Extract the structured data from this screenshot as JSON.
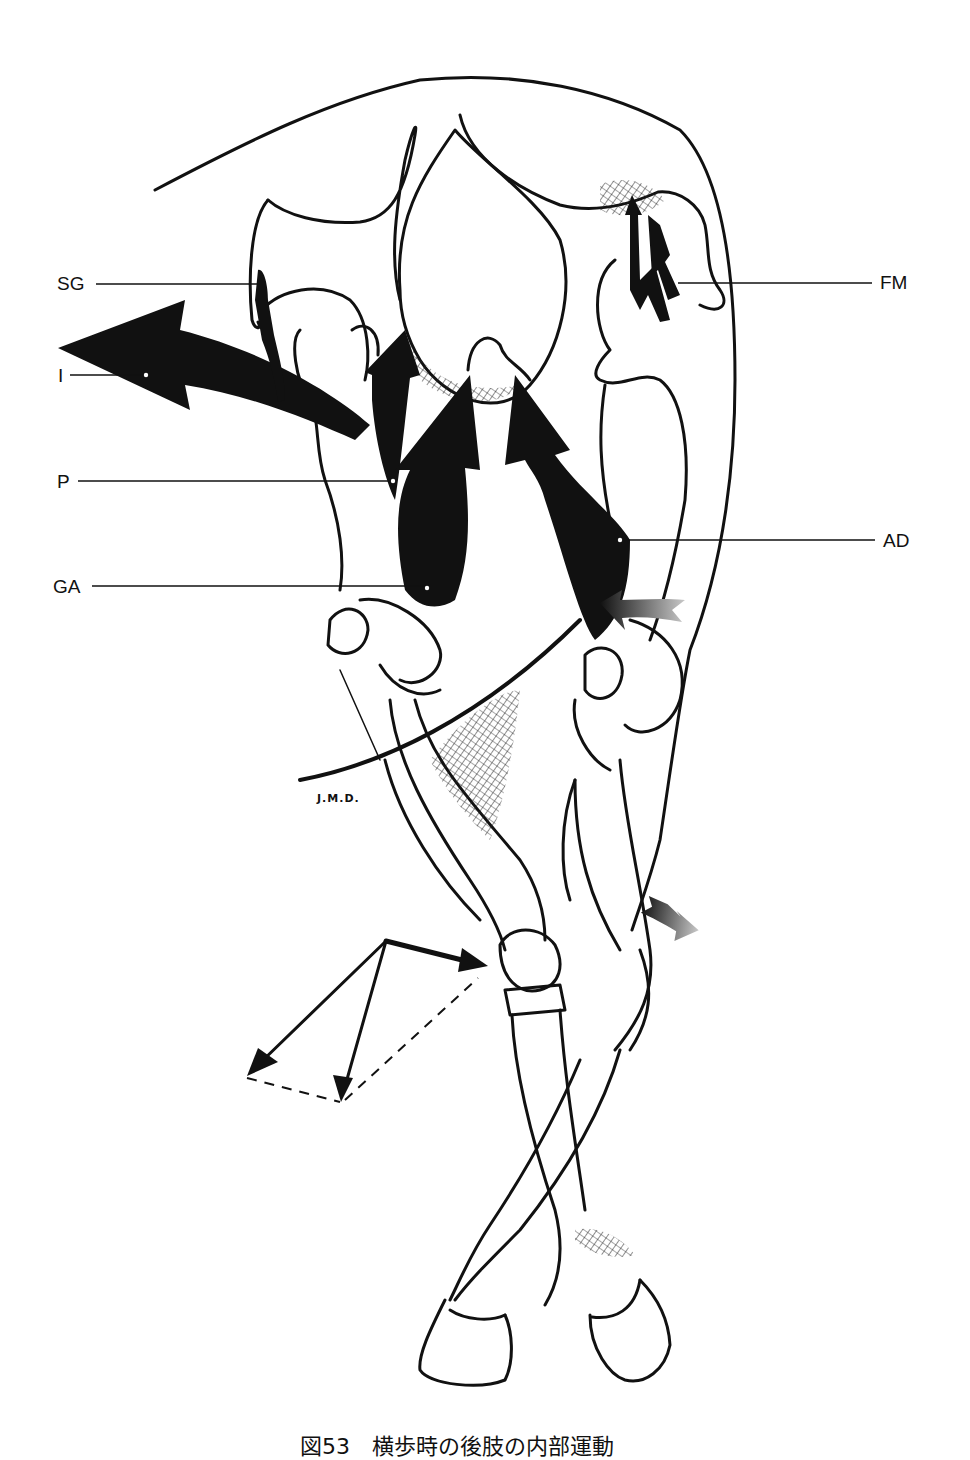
{
  "figure": {
    "caption": "図53　横歩時の後肢の内部運動",
    "signature": "J.M.D.",
    "labels": {
      "sg": "SG",
      "i": "I",
      "p": "P",
      "ga": "GA",
      "fm": "FM",
      "ad": "AD"
    },
    "colors": {
      "ink": "#111111",
      "background": "#ffffff",
      "gradient_arrow_dark": "#111111",
      "gradient_arrow_light": "#bbbbbb"
    }
  }
}
